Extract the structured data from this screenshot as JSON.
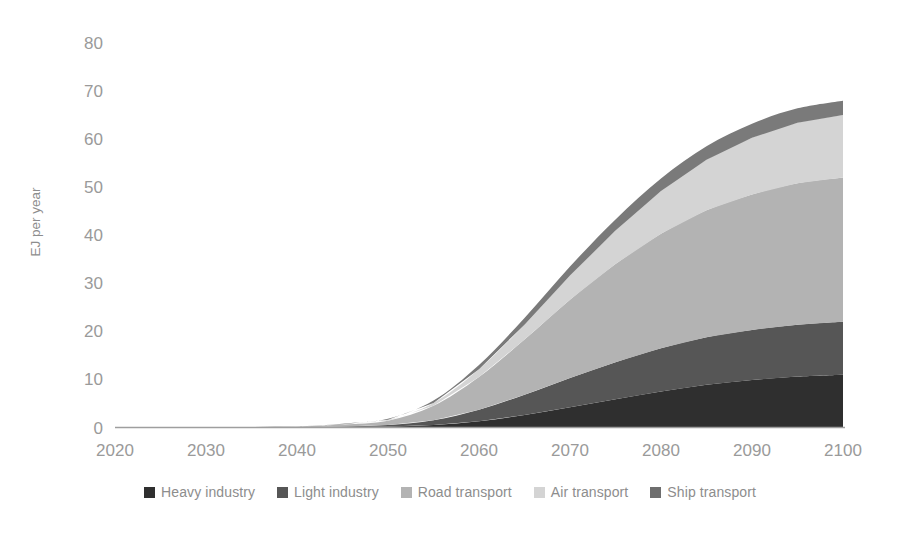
{
  "chart_data": {
    "type": "area",
    "stacked": true,
    "title": "",
    "subtitle": "",
    "xlabel": "",
    "ylabel": "EJ per year",
    "xlim": [
      2020,
      2100
    ],
    "ylim": [
      0,
      80
    ],
    "grid": false,
    "legend_position": "bottom",
    "x": [
      2020,
      2025,
      2030,
      2035,
      2040,
      2045,
      2050,
      2055,
      2060,
      2065,
      2070,
      2075,
      2080,
      2085,
      2090,
      2095,
      2100
    ],
    "xticks": [
      "2020",
      "2030",
      "2040",
      "2050",
      "2060",
      "2070",
      "2080",
      "2090",
      "2100"
    ],
    "yticks": [
      "0",
      "10",
      "20",
      "30",
      "40",
      "50",
      "60",
      "70",
      "80"
    ],
    "series": [
      {
        "name": "Heavy industry",
        "color": "#2f2f2f",
        "values": [
          0,
          0,
          0,
          0,
          0,
          0.1,
          0.2,
          0.5,
          1.3,
          2.6,
          4.2,
          5.9,
          7.5,
          8.9,
          9.9,
          10.6,
          11.0
        ]
      },
      {
        "name": "Light industry",
        "color": "#565656",
        "values": [
          0,
          0,
          0,
          0,
          0,
          0.1,
          0.3,
          1.0,
          2.4,
          4.2,
          6.1,
          7.7,
          9.0,
          9.9,
          10.4,
          10.8,
          11.0
        ]
      },
      {
        "name": "Road transport",
        "color": "#b3b3b3",
        "values": [
          0,
          0,
          0,
          0.1,
          0.2,
          0.4,
          0.9,
          3.0,
          6.8,
          11.5,
          16.3,
          20.4,
          23.8,
          26.4,
          28.2,
          29.4,
          30.0
        ]
      },
      {
        "name": "Air transport",
        "color": "#d4d4d4",
        "values": [
          0,
          0,
          0,
          0,
          0,
          0.1,
          0.2,
          0.6,
          1.6,
          3.1,
          5.0,
          7.0,
          8.9,
          10.5,
          11.8,
          12.6,
          13.0
        ]
      },
      {
        "name": "Ship transport",
        "color": "#7a7a7a",
        "values": [
          0,
          0,
          0,
          0,
          0,
          0.1,
          0.2,
          0.5,
          0.9,
          1.4,
          1.9,
          2.3,
          2.6,
          2.8,
          2.9,
          3.0,
          3.0
        ]
      }
    ],
    "totals_at_2100": {
      "heavy_industry": 11.0,
      "light_industry_cumulative": 22.0,
      "road_transport_cumulative": 52.0,
      "air_transport_cumulative": 65.0,
      "ship_transport_cumulative": 68.0
    }
  },
  "axis": {
    "y_label": "EJ per year",
    "y_ticks": [
      "80",
      "70",
      "60",
      "50",
      "40",
      "30",
      "20",
      "10",
      "0"
    ],
    "x_ticks": [
      "2020",
      "2030",
      "2040",
      "2050",
      "2060",
      "2070",
      "2080",
      "2090",
      "2100"
    ]
  },
  "legend": {
    "items": [
      {
        "label": "Heavy industry",
        "color": "#2f2f2f"
      },
      {
        "label": "Light industry",
        "color": "#565656"
      },
      {
        "label": "Road transport",
        "color": "#b3b3b3"
      },
      {
        "label": "Air transport",
        "color": "#d4d4d4"
      },
      {
        "label": "Ship transport",
        "color": "#6e6e6e"
      }
    ]
  },
  "colors": {
    "axis_line": "#9e9e9e",
    "tick_text": "#9a9a9a",
    "background": "#ffffff"
  }
}
